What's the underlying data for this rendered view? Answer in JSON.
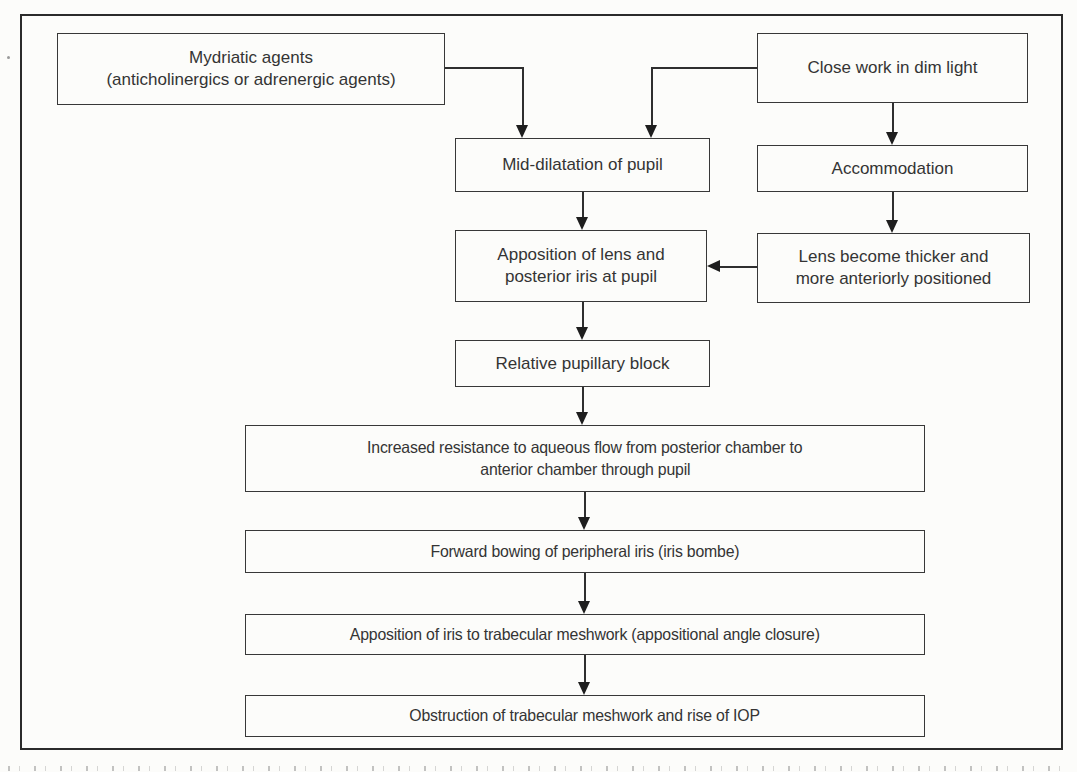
{
  "figure": {
    "type": "flowchart",
    "topic": "Pathogenesis of pupillary block in angle-closure (flowchart as rendered)",
    "nodes": {
      "mydriatic": {
        "label": "Mydriatic agents (anticholinergics or adrenergic agents)",
        "lines": [
          "Mydriatic agents",
          "(anticholinergics or adrenergic agents)"
        ]
      },
      "close_work": {
        "label": "Close work in dim light"
      },
      "mid_dilatation": {
        "label": "Mid-dilatation of pupil"
      },
      "accommodation": {
        "label": "Accommodation"
      },
      "apposition_lens": {
        "label": "Apposition of lens and posterior iris at pupil",
        "lines": [
          "Apposition of lens and",
          "posterior iris at pupil"
        ]
      },
      "lens_thicker": {
        "label": "Lens become thicker and more anteriorly positioned",
        "lines": [
          "Lens become thicker and",
          "more anteriorly positioned"
        ]
      },
      "pupillary_block": {
        "label": "Relative pupillary block"
      },
      "increased_resistance": {
        "label": "Increased resistance to aqueous flow from posterior chamber to anterior chamber through pupil",
        "lines": [
          "Increased resistance to aqueous flow from posterior chamber to",
          "anterior chamber through pupil"
        ]
      },
      "iris_bombe": {
        "label": "Forward bowing of peripheral iris (iris bombe)"
      },
      "appositional_closure": {
        "label": "Apposition of iris to trabecular meshwork (appositional angle closure)"
      },
      "obstruction_iop": {
        "label": "Obstruction of trabecular meshwork and rise of IOP"
      }
    },
    "edges": [
      {
        "from": "mydriatic",
        "to": "mid_dilatation"
      },
      {
        "from": "close_work",
        "to": "mid_dilatation"
      },
      {
        "from": "close_work",
        "to": "accommodation"
      },
      {
        "from": "mid_dilatation",
        "to": "apposition_lens"
      },
      {
        "from": "accommodation",
        "to": "lens_thicker"
      },
      {
        "from": "lens_thicker",
        "to": "apposition_lens"
      },
      {
        "from": "apposition_lens",
        "to": "pupillary_block"
      },
      {
        "from": "pupillary_block",
        "to": "increased_resistance"
      },
      {
        "from": "increased_resistance",
        "to": "iris_bombe"
      },
      {
        "from": "iris_bombe",
        "to": "appositional_closure"
      },
      {
        "from": "appositional_closure",
        "to": "obstruction_iop"
      }
    ],
    "colors": {
      "line": "#2f2f2f",
      "text": "#343434",
      "background": "#fcfcfa"
    }
  }
}
